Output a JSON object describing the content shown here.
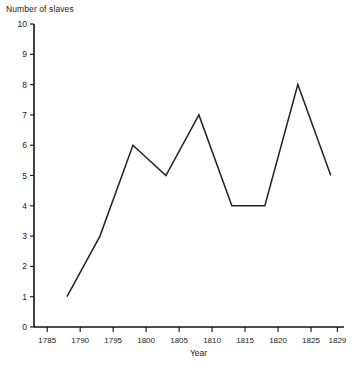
{
  "chart_data": {
    "type": "line",
    "title": "",
    "xlabel": "Year",
    "ylabel": "Number of slaves",
    "x": [
      1788,
      1793,
      1798,
      1803,
      1808,
      1813,
      1818,
      1823,
      1828
    ],
    "values": [
      1,
      3,
      6,
      5,
      7,
      4,
      4,
      8,
      5
    ],
    "series": [
      {
        "name": "Number of slaves",
        "values": [
          1,
          3,
          6,
          5,
          7,
          4,
          4,
          8,
          5
        ]
      }
    ],
    "xlim": [
      1783,
      1830
    ],
    "ylim": [
      0,
      10
    ],
    "ytick_labels": [
      "0",
      "1",
      "2",
      "3",
      "4",
      "5",
      "6",
      "7",
      "8",
      "9",
      "10"
    ],
    "ytick_values": [
      0,
      1,
      2,
      3,
      4,
      5,
      6,
      7,
      8,
      9,
      10
    ],
    "xtick_labels": [
      "1785",
      "1790",
      "1795",
      "1800",
      "1805",
      "1810",
      "1815",
      "1820",
      "1825",
      "1829"
    ],
    "xtick_values": [
      1785,
      1790,
      1795,
      1800,
      1805,
      1810,
      1815,
      1820,
      1825,
      1829
    ],
    "grid": false,
    "legend": false,
    "line_color": "#222222",
    "axis_color": "#111111",
    "background": "#ffffff"
  }
}
